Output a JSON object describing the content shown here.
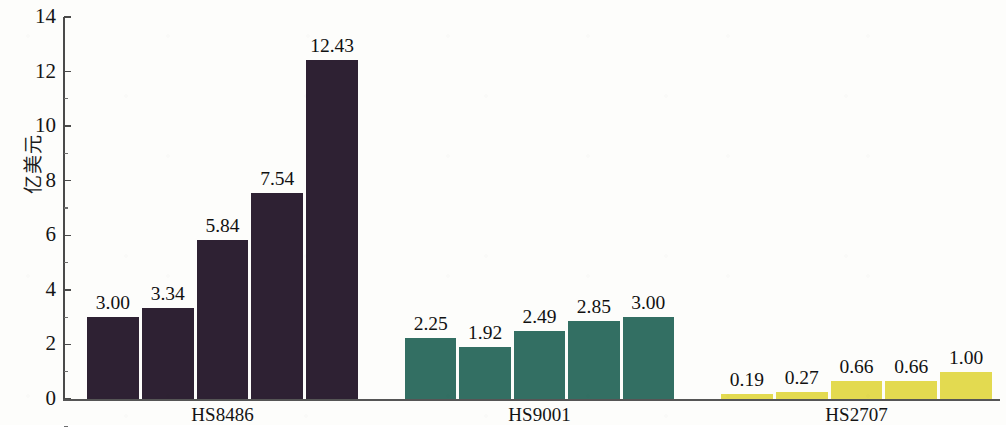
{
  "chart_data": {
    "type": "bar",
    "title": "",
    "xlabel": "",
    "ylabel": "亿美元",
    "ylim": [
      0,
      14
    ],
    "ytick_values": [
      0,
      2,
      4,
      6,
      8,
      10,
      12,
      14
    ],
    "ytick_labels": [
      "0",
      "2",
      "4",
      "6",
      "8",
      "10",
      "12",
      "14"
    ],
    "grid": false,
    "legend": "none",
    "categories": [
      "HS8486",
      "HS9001",
      "HS2707"
    ],
    "groups": [
      {
        "category": "HS8486",
        "color": "#2e2133",
        "values": [
          3.0,
          3.34,
          5.84,
          7.54,
          12.43
        ],
        "labels": [
          "3.00",
          "3.34",
          "5.84",
          "7.54",
          "12.43"
        ]
      },
      {
        "category": "HS9001",
        "color": "#336f63",
        "values": [
          2.25,
          1.92,
          2.49,
          2.85,
          3.0
        ],
        "labels": [
          "2.25",
          "1.92",
          "2.49",
          "2.85",
          "3.00"
        ]
      },
      {
        "category": "HS2707",
        "color": "#e3da50",
        "values": [
          0.19,
          0.27,
          0.66,
          0.66,
          1.0
        ],
        "labels": [
          "0.19",
          "0.27",
          "0.66",
          "0.66",
          "1.00"
        ]
      }
    ]
  },
  "axis": {
    "y_title": "亿美元",
    "y_ticks": [
      "14",
      "12",
      "10",
      "8",
      "6",
      "4",
      "2",
      "0"
    ]
  },
  "colors": {
    "series_1": "#2e2133",
    "series_2": "#336f63",
    "series_3": "#e3da50",
    "axis": "#4a4a4a",
    "text": "#141414",
    "background": "#fdfdfb"
  }
}
